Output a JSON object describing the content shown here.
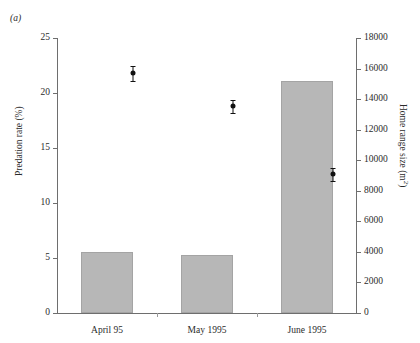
{
  "figure": {
    "panel_label": "(a)"
  },
  "chart_data": {
    "type": "bar",
    "title": "",
    "subtitle": "",
    "categories": [
      "April 95",
      "May 1995",
      "June 1995"
    ],
    "xlabel": "",
    "grid": false,
    "legend": "none",
    "annotations": [
      "(a)"
    ],
    "axes": {
      "left": {
        "label": "Predation rate (%)",
        "ylim": [
          0,
          25
        ],
        "ticks": [
          0,
          5,
          10,
          15,
          20,
          25
        ],
        "tick_labels": [
          "0",
          "5",
          "10",
          "15",
          "20",
          "25"
        ]
      },
      "right": {
        "label": "Home range size (m2)",
        "label_base": "Home range size (m",
        "label_sup": "2",
        "label_close": ")",
        "ylim": [
          0,
          18000
        ],
        "ticks": [
          0,
          2000,
          4000,
          6000,
          8000,
          10000,
          12000,
          14000,
          16000,
          18000
        ],
        "tick_labels": [
          "0",
          "2000",
          "4000",
          "6000",
          "8000",
          "10000",
          "12000",
          "14000",
          "16000",
          "18000"
        ]
      }
    },
    "series": [
      {
        "name": "Home range size (m2)",
        "type": "bar",
        "axis": "right",
        "color": "#b7b7b7",
        "values": [
          4000,
          3800,
          15200
        ]
      },
      {
        "name": "Predation rate (%)",
        "type": "scatter",
        "axis": "left",
        "color": "#111111",
        "values": [
          21.8,
          18.8,
          12.6
        ],
        "errors": [
          0.7,
          0.6,
          0.6
        ]
      }
    ]
  }
}
